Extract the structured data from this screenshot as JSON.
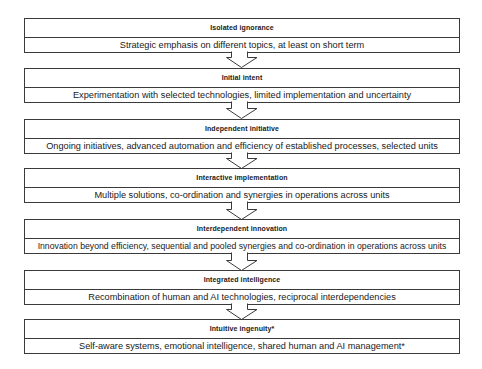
{
  "diagram": {
    "type": "vertical-flow",
    "stages": [
      {
        "title": "Isolated ignorance",
        "description": "Strategic emphasis on different topics, at least on short term"
      },
      {
        "title": "Initial intent",
        "description": "Experimentation with selected technologies, limited implementation and uncertainty"
      },
      {
        "title": "Independent initiative",
        "description": "Ongoing initiatives, advanced automation and efficiency of established processes, selected units"
      },
      {
        "title": "Interactive implementation",
        "description": "Multiple solutions, co-ordination and synergies in operations across units"
      },
      {
        "title": "Interdependent innovation",
        "description": "Innovation beyond efficiency, sequential and pooled synergies and co-ordination in operations across units"
      },
      {
        "title": "Integrated intelligence",
        "description": "Recombination of human and AI technologies, reciprocal interdependencies"
      },
      {
        "title": "Intuitive ingenuity*",
        "description": "Self-aware systems, emotional intelligence, shared human and AI management*"
      }
    ],
    "connector": "down-arrow-outline"
  }
}
